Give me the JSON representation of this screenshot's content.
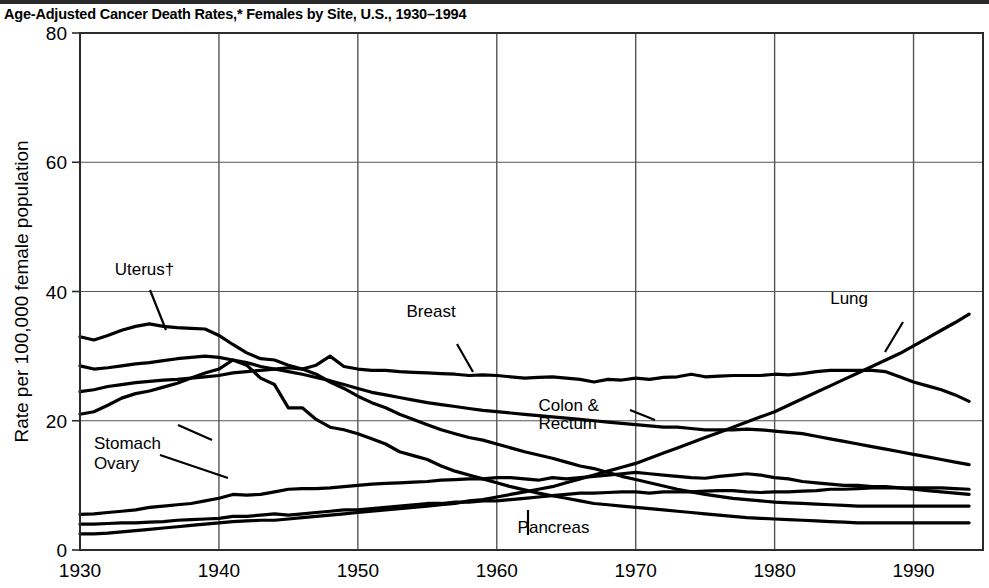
{
  "title": "Age-Adjusted Cancer Death Rates,* Females by Site, U.S., 1930–1994",
  "axes": {
    "ylabel": "Rate per 100,000 female population",
    "yticks": [
      "0",
      "20",
      "40",
      "60",
      "80"
    ],
    "xticks": [
      "1930",
      "1940",
      "1950",
      "1960",
      "1970",
      "1980",
      "1990"
    ]
  },
  "labels": {
    "uterus": "Uterus†",
    "breast": "Breast",
    "lung": "Lung",
    "colon_rectum_1": "Colon &",
    "colon_rectum_2": "Rectum",
    "stomach": "Stomach",
    "ovary": "Ovary",
    "pancreas": "Pancreas"
  },
  "colors": {
    "line": "#000000",
    "grid": "#555555",
    "background": "#ffffff"
  },
  "chart_data": {
    "type": "line",
    "title": "Age-Adjusted Cancer Death Rates,* Females by Site, U.S., 1930–1994",
    "xlabel": "",
    "ylabel": "Rate per 100,000 female population",
    "xlim": [
      1930,
      1995
    ],
    "ylim": [
      0,
      80
    ],
    "yticks": [
      0,
      20,
      40,
      60,
      80
    ],
    "xticks": [
      1930,
      1940,
      1950,
      1960,
      1970,
      1980,
      1990
    ],
    "grid": true,
    "legend": "inline-annotations",
    "x": [
      1930,
      1931,
      1932,
      1933,
      1934,
      1935,
      1936,
      1937,
      1938,
      1939,
      1940,
      1941,
      1942,
      1943,
      1944,
      1945,
      1946,
      1947,
      1948,
      1949,
      1950,
      1951,
      1952,
      1953,
      1954,
      1955,
      1956,
      1957,
      1958,
      1959,
      1960,
      1961,
      1962,
      1963,
      1964,
      1965,
      1966,
      1967,
      1968,
      1969,
      1970,
      1971,
      1972,
      1973,
      1974,
      1975,
      1976,
      1977,
      1978,
      1979,
      1980,
      1981,
      1982,
      1983,
      1984,
      1985,
      1986,
      1987,
      1988,
      1989,
      1990,
      1991,
      1992,
      1993,
      1994
    ],
    "series": [
      {
        "name": "Uterus†",
        "values": [
          33.0,
          32.5,
          33.2,
          34.0,
          34.6,
          35.0,
          34.6,
          34.4,
          34.3,
          34.2,
          33.2,
          31.8,
          30.5,
          29.6,
          29.4,
          28.6,
          28.0,
          27.2,
          26.0,
          25.0,
          23.8,
          22.8,
          22.0,
          21.0,
          20.2,
          19.4,
          18.6,
          18.0,
          17.4,
          17.0,
          16.4,
          15.8,
          15.2,
          14.7,
          14.2,
          13.6,
          13.0,
          12.6,
          12.0,
          11.4,
          10.9,
          10.4,
          9.9,
          9.4,
          9.0,
          8.6,
          8.3,
          8.0,
          7.8,
          7.6,
          7.4,
          7.3,
          7.2,
          7.1,
          7.0,
          6.9,
          6.8,
          6.8,
          6.8,
          6.8,
          6.8,
          6.8,
          6.8,
          6.8,
          6.8
        ]
      },
      {
        "name": "Breast",
        "values": [
          24.5,
          24.8,
          25.3,
          25.6,
          25.9,
          26.1,
          26.3,
          26.4,
          26.6,
          26.8,
          27.0,
          27.4,
          27.6,
          27.8,
          28.0,
          28.2,
          28.0,
          28.6,
          30.0,
          28.4,
          28.0,
          27.8,
          27.8,
          27.6,
          27.5,
          27.4,
          27.3,
          27.2,
          27.0,
          27.1,
          27.0,
          26.8,
          26.6,
          26.7,
          26.8,
          26.6,
          26.4,
          26.0,
          26.4,
          26.3,
          26.6,
          26.4,
          26.7,
          26.8,
          27.2,
          26.8,
          26.9,
          27.0,
          27.0,
          27.0,
          27.2,
          27.1,
          27.3,
          27.6,
          27.8,
          27.8,
          27.8,
          27.8,
          27.6,
          26.8,
          26.0,
          25.4,
          24.8,
          24.0,
          23.0
        ]
      },
      {
        "name": "Colon & Rectum",
        "values": [
          28.5,
          28.0,
          28.2,
          28.5,
          28.8,
          29.0,
          29.3,
          29.6,
          29.8,
          30.0,
          29.8,
          29.4,
          29.0,
          28.4,
          28.0,
          27.6,
          27.2,
          26.7,
          26.2,
          25.6,
          25.0,
          24.4,
          24.0,
          23.6,
          23.2,
          22.8,
          22.5,
          22.2,
          21.9,
          21.6,
          21.4,
          21.2,
          21.0,
          20.8,
          20.6,
          20.4,
          20.2,
          20.0,
          19.8,
          19.6,
          19.4,
          19.2,
          19.0,
          19.0,
          18.8,
          18.6,
          18.6,
          18.6,
          18.7,
          18.6,
          18.4,
          18.2,
          18.0,
          17.6,
          17.2,
          16.8,
          16.4,
          16.0,
          15.6,
          15.2,
          14.8,
          14.4,
          14.0,
          13.6,
          13.2
        ]
      },
      {
        "name": "Stomach",
        "values": [
          21.0,
          21.4,
          22.4,
          23.5,
          24.2,
          24.6,
          25.2,
          25.8,
          26.6,
          27.4,
          28.0,
          29.4,
          28.6,
          26.6,
          25.6,
          22.0,
          22.0,
          20.2,
          19.0,
          18.6,
          18.0,
          17.2,
          16.4,
          15.2,
          14.6,
          14.0,
          13.0,
          12.2,
          11.6,
          11.0,
          10.4,
          9.8,
          9.3,
          8.8,
          8.4,
          8.0,
          7.6,
          7.2,
          7.0,
          6.8,
          6.6,
          6.4,
          6.2,
          6.0,
          5.8,
          5.6,
          5.4,
          5.2,
          5.0,
          4.9,
          4.8,
          4.7,
          4.6,
          4.5,
          4.4,
          4.3,
          4.2,
          4.2,
          4.2,
          4.2,
          4.2,
          4.2,
          4.2,
          4.2,
          4.2
        ]
      },
      {
        "name": "Ovary",
        "values": [
          5.5,
          5.6,
          5.8,
          6.0,
          6.2,
          6.6,
          6.8,
          7.0,
          7.2,
          7.6,
          8.0,
          8.6,
          8.5,
          8.6,
          9.0,
          9.4,
          9.5,
          9.5,
          9.6,
          9.8,
          10.0,
          10.2,
          10.3,
          10.4,
          10.5,
          10.6,
          10.8,
          10.9,
          11.0,
          11.0,
          11.2,
          11.2,
          11.0,
          10.8,
          11.2,
          11.0,
          11.2,
          11.4,
          11.6,
          11.8,
          12.0,
          11.8,
          11.6,
          11.4,
          11.2,
          11.1,
          11.4,
          11.6,
          11.8,
          11.6,
          11.2,
          11.0,
          10.6,
          10.4,
          10.2,
          10.0,
          10.0,
          9.8,
          9.8,
          9.6,
          9.4,
          9.2,
          9.0,
          8.8,
          8.6
        ]
      },
      {
        "name": "Pancreas",
        "values": [
          4.0,
          4.0,
          4.1,
          4.2,
          4.2,
          4.3,
          4.4,
          4.6,
          4.7,
          4.8,
          4.9,
          5.2,
          5.2,
          5.4,
          5.6,
          5.4,
          5.6,
          5.8,
          6.0,
          6.2,
          6.2,
          6.4,
          6.6,
          6.8,
          7.0,
          7.2,
          7.2,
          7.4,
          7.4,
          7.6,
          7.6,
          7.8,
          8.0,
          8.2,
          8.4,
          8.6,
          8.8,
          8.8,
          8.9,
          9.0,
          9.0,
          8.8,
          9.0,
          9.0,
          9.0,
          9.1,
          9.2,
          9.2,
          9.0,
          8.9,
          9.0,
          9.0,
          9.1,
          9.2,
          9.4,
          9.4,
          9.5,
          9.6,
          9.6,
          9.6,
          9.6,
          9.6,
          9.6,
          9.5,
          9.4
        ]
      },
      {
        "name": "Lung",
        "values": [
          2.5,
          2.5,
          2.6,
          2.8,
          3.0,
          3.2,
          3.4,
          3.6,
          3.8,
          4.0,
          4.2,
          4.4,
          4.5,
          4.6,
          4.6,
          4.8,
          5.0,
          5.2,
          5.4,
          5.6,
          5.8,
          6.0,
          6.2,
          6.4,
          6.6,
          6.8,
          7.0,
          7.2,
          7.6,
          7.8,
          8.2,
          8.6,
          9.0,
          9.4,
          9.8,
          10.4,
          11.0,
          11.6,
          12.2,
          12.8,
          13.4,
          14.2,
          15.0,
          15.8,
          16.6,
          17.4,
          18.2,
          19.0,
          19.8,
          20.6,
          21.4,
          22.4,
          23.4,
          24.4,
          25.4,
          26.4,
          27.4,
          28.4,
          29.4,
          30.4,
          31.6,
          32.8,
          34.0,
          35.2,
          36.5
        ]
      }
    ],
    "annotations": [
      {
        "text": "Uterus†",
        "x": 1932.5,
        "y": 42.5
      },
      {
        "text": "Breast",
        "x": 1953.5,
        "y": 36.0
      },
      {
        "text": "Lung",
        "x": 1984.0,
        "y": 38.0
      },
      {
        "text": "Colon &",
        "x": 1963.0,
        "y": 21.5
      },
      {
        "text": "Rectum",
        "x": 1963.0,
        "y": 18.8
      },
      {
        "text": "Stomach",
        "x": 1931.0,
        "y": 15.6
      },
      {
        "text": "Ovary",
        "x": 1931.0,
        "y": 12.6
      },
      {
        "text": "Pancreas",
        "x": 1961.5,
        "y": 2.6
      }
    ]
  }
}
